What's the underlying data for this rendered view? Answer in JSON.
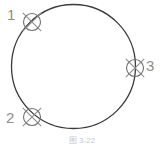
{
  "figure": {
    "caption": "图 3-22",
    "background_color": "#ffffff",
    "stroke_color": "#3a3a3a",
    "marker_stroke_color": "#8d8d8d",
    "label_color": "#8d8d8d",
    "caption_color": "#c9c9c9",
    "main_circle": {
      "name": "main-circle",
      "center_x": 73.5,
      "center_y": 66.5,
      "radius": 62,
      "stroke_width": 1.3
    },
    "markers": [
      {
        "id": "1",
        "label": "1",
        "symbol": "circled-x",
        "center_x": 32,
        "center_y": 22,
        "radius": 8.5,
        "arm_length": 13,
        "label_x": 7,
        "label_y": 7
      },
      {
        "id": "2",
        "label": "2",
        "symbol": "circled-x",
        "center_x": 32,
        "center_y": 117,
        "radius": 8.5,
        "arm_length": 13,
        "label_x": 6,
        "label_y": 110
      },
      {
        "id": "3",
        "label": "3",
        "symbol": "circled-x",
        "center_x": 135,
        "center_y": 68,
        "radius": 8.5,
        "arm_length": 13,
        "label_x": 146,
        "label_y": 58
      }
    ]
  }
}
